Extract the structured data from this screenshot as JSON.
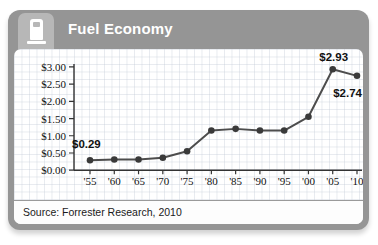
{
  "header": {
    "title": "Fuel Economy",
    "icon": "gas-pump-icon"
  },
  "footer": {
    "source": "Source: Forrester Research, 2010"
  },
  "colors": {
    "frame": "#959595",
    "icon_tab": "#b7b7b7",
    "title_text": "#ffffff",
    "line": "#4d4d4d",
    "point": "#3a3a3a",
    "axis": "#333333",
    "label_text": "#111111"
  },
  "chart_data": {
    "type": "line",
    "title": "Fuel Economy",
    "x": [
      "'55",
      "'60",
      "'65",
      "'70",
      "'75",
      "'80",
      "'85",
      "'90",
      "'95",
      "'00",
      "'05",
      "'10"
    ],
    "values": [
      0.29,
      0.31,
      0.31,
      0.36,
      0.55,
      1.15,
      1.2,
      1.15,
      1.15,
      1.55,
      2.93,
      2.74
    ],
    "xlabel": "",
    "ylabel": "",
    "ylim": [
      0,
      3.0
    ],
    "ytick_step": 0.5,
    "ytick_labels": [
      "$0.00",
      "$0.50",
      "$1.00",
      "$1.50",
      "$2.00",
      "$2.50",
      "$3.00"
    ],
    "grid": "graph-paper background",
    "legend": "none",
    "point_labels": [
      {
        "index": 0,
        "text": "$0.29",
        "position": "above-left"
      },
      {
        "index": 10,
        "text": "$2.93",
        "position": "above"
      },
      {
        "index": 11,
        "text": "$2.74",
        "position": "below-right"
      }
    ]
  }
}
